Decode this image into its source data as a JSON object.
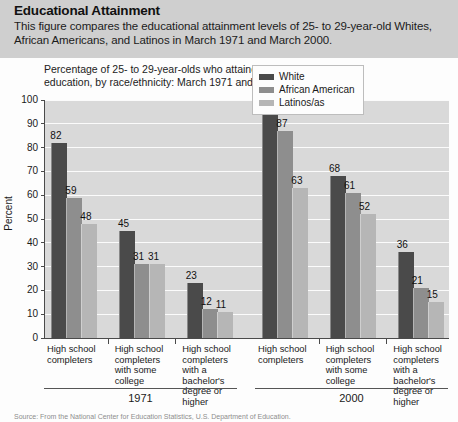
{
  "header": {
    "title": "Educational Attainment",
    "description": "This figure compares the educational attainment levels of 25- to 29-year-old Whites, African Americans, and Latinos in March 1971 and March 2000."
  },
  "figure": {
    "caption": "Percentage of 25- to 29-year-olds who attained selected levels of education, by race/ethnicity: March 1971 and 2000.",
    "source": "Source: From the National Center for Education Statistics, U.S. Department of Education."
  },
  "colors": {
    "white_series": "#4a4a4a",
    "african_american_series": "#8e8e8e",
    "latino_series": "#b6b6b6",
    "plot_background": "#d9d9d9",
    "header_band": "#cfcfcf",
    "gridline": "#fbfbfb",
    "axis": "#4a4a4a"
  },
  "chart_data": {
    "type": "bar",
    "title": "Percentage of 25- to 29-year-olds who attained selected levels of education, by race/ethnicity: March 1971 and 2000.",
    "xlabel": "",
    "ylabel": "Percent",
    "ylim": [
      0,
      100
    ],
    "yticks": [
      0,
      10,
      20,
      30,
      40,
      50,
      60,
      70,
      80,
      90,
      100
    ],
    "grid": true,
    "legend_position": "top-right",
    "groups": [
      "1971",
      "2000"
    ],
    "categories": [
      "High school completers",
      "High school completers with some college",
      "High school completers with a bachelor's degree or higher"
    ],
    "series": [
      {
        "name": "White",
        "color": "#4a4a4a",
        "values": {
          "1971": [
            82,
            45,
            23
          ],
          "2000": [
            94,
            68,
            36
          ]
        }
      },
      {
        "name": "African American",
        "color": "#8e8e8e",
        "values": {
          "1971": [
            59,
            31,
            12
          ],
          "2000": [
            87,
            61,
            21
          ]
        }
      },
      {
        "name": "Latinos/as",
        "color": "#b6b6b6",
        "values": {
          "1971": [
            48,
            31,
            11
          ],
          "2000": [
            63,
            52,
            15
          ]
        }
      }
    ]
  },
  "legend": {
    "items": [
      {
        "label": "White"
      },
      {
        "label": "African American"
      },
      {
        "label": "Latinos/as"
      }
    ]
  },
  "category_labels": [
    {
      "line1": "High school",
      "line2": "completers",
      "line3": "",
      "line4": ""
    },
    {
      "line1": "High school",
      "line2": "completers",
      "line3": "with some",
      "line4": "college"
    },
    {
      "line1": "High school",
      "line2": "completers",
      "line3": "with a bachelor's",
      "line4": "degree or higher"
    }
  ],
  "group_labels": [
    "1971",
    "2000"
  ],
  "y_axis_title": "Percent"
}
